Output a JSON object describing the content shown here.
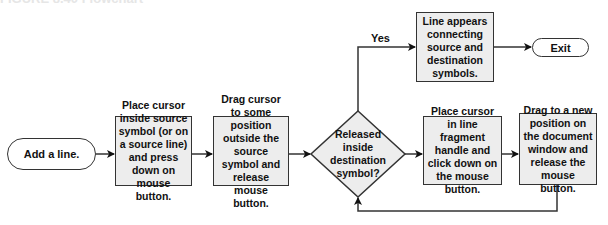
{
  "caption": "FIGURE 8.40  Flowchart",
  "flowchart": {
    "start": {
      "label": "Add a line."
    },
    "step1": {
      "label": "Place cursor inside source symbol (or on a source line) and press down on mouse button."
    },
    "step2": {
      "label": "Drag cursor to some position outside the source symbol and release mouse button."
    },
    "decision": {
      "label": "Released inside destination symbol?"
    },
    "yes_label": "Yes",
    "success": {
      "label": "Line appears connecting source and destination symbols."
    },
    "exit": {
      "label": "Exit"
    },
    "step3": {
      "label": "Place cursor in line fragment handle and click down on the mouse button."
    },
    "step4": {
      "label": "Drag to a new position on the document window and release the mouse button."
    }
  },
  "colors": {
    "box_fill": "#ededed",
    "stroke": "#333333"
  }
}
